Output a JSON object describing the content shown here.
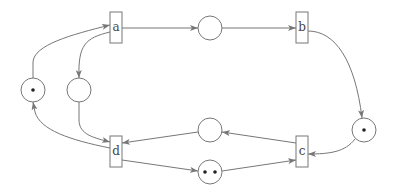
{
  "diagram": {
    "type": "petri-net",
    "colors": {
      "stroke": "#777777",
      "token": "#222222",
      "background": "#ffffff"
    },
    "transitions": [
      {
        "id": "a",
        "label": "a",
        "x": 110,
        "y": 12,
        "w": 12,
        "h": 31
      },
      {
        "id": "b",
        "label": "b",
        "x": 296,
        "y": 12,
        "w": 12,
        "h": 31
      },
      {
        "id": "c",
        "label": "c",
        "x": 296,
        "y": 136,
        "w": 12,
        "h": 31
      },
      {
        "id": "d",
        "label": "d",
        "x": 110,
        "y": 136,
        "w": 12,
        "h": 31
      }
    ],
    "places": [
      {
        "id": "p_ab",
        "cx": 210,
        "cy": 28,
        "r": 12,
        "tokens": 0
      },
      {
        "id": "p_b_c",
        "cx": 364,
        "cy": 130,
        "r": 12,
        "tokens": 1
      },
      {
        "id": "p_cd",
        "cx": 210,
        "cy": 130,
        "r": 12,
        "tokens": 0
      },
      {
        "id": "p_dc",
        "cx": 210,
        "cy": 172,
        "r": 12,
        "tokens": 2
      },
      {
        "id": "p_da",
        "cx": 33,
        "cy": 90,
        "r": 12,
        "tokens": 1
      },
      {
        "id": "p_ad",
        "cx": 79,
        "cy": 90,
        "r": 12,
        "tokens": 0
      }
    ],
    "arcs": [
      {
        "from": "a",
        "to": "p_ab"
      },
      {
        "from": "p_ab",
        "to": "b"
      },
      {
        "from": "b",
        "to": "p_b_c"
      },
      {
        "from": "p_b_c",
        "to": "c"
      },
      {
        "from": "c",
        "to": "p_cd"
      },
      {
        "from": "p_cd",
        "to": "d"
      },
      {
        "from": "d",
        "to": "p_dc"
      },
      {
        "from": "p_dc",
        "to": "c"
      },
      {
        "from": "d",
        "to": "p_da"
      },
      {
        "from": "p_da",
        "to": "a"
      },
      {
        "from": "a",
        "to": "p_ad"
      },
      {
        "from": "p_ad",
        "to": "d"
      }
    ]
  }
}
